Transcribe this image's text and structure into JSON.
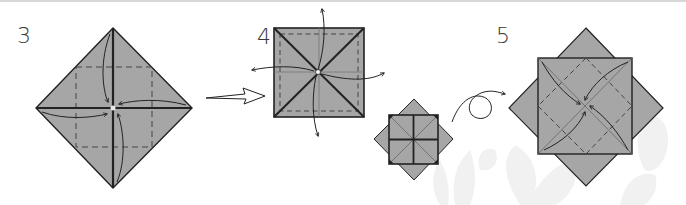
{
  "diagram": {
    "type": "origami-instructions",
    "colors": {
      "paper": "#a6a6a6",
      "outline": "#222222",
      "crease": "#555555",
      "arrow": "#222222",
      "watermark": "#f1f1f1",
      "background": "#ffffff"
    },
    "steps": [
      {
        "number": "3",
        "shape": "diamond",
        "description": "Fold four corners to the center (blintz), arrows point inward"
      },
      {
        "number": "4",
        "shape": "square",
        "description": "Unfold the four flaps outward, arrows point away from the center"
      },
      {
        "number": "",
        "shape": "star-octagon",
        "description": "Result view: square over diamond with creases"
      },
      {
        "number": "5",
        "shape": "square-over-diamond",
        "description": "Fold four corners diagonally to the center"
      }
    ],
    "transitions": [
      {
        "from": "3",
        "to": "4",
        "symbol": "hollow-arrow"
      },
      {
        "from": "small",
        "to": "5",
        "symbol": "turn-over-arrow"
      }
    ]
  }
}
